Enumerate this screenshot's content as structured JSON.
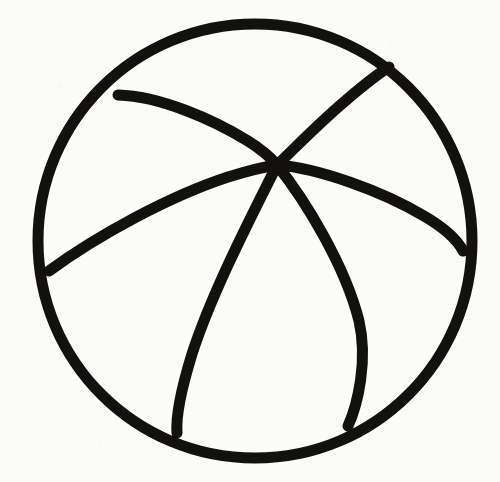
{
  "document": {
    "kind": "line-drawing",
    "subject": "beach ball",
    "description": "Hand-drawn black ink outline of a beach ball: one large circle crossed by five curved seam lines that all converge at a single point above the circle's centre.",
    "medium": "ink on paper",
    "canvas": {
      "width": 500,
      "height": 482
    },
    "background_color": "#fbfbfa",
    "ink_color": "#121110"
  },
  "geometry": {
    "outline": {
      "name": "ball-outline",
      "shape": "circle",
      "center": {
        "x": 255,
        "y": 241
      },
      "radius": 217,
      "stroke_width": 11,
      "bounds": {
        "left": 38,
        "top": 24,
        "right": 472,
        "bottom": 458
      },
      "path": "M 255 24 C 375 24 472 121 472 241 C 472 361 375 458 255 458 C 135 458 38 361 38 241 C 38 121 135 24 255 24 Z"
    },
    "convergence_point": {
      "x": 277,
      "y": 165
    },
    "seams": [
      {
        "name": "seam-upper-left",
        "from": {
          "x": 118,
          "y": 95
        },
        "to": {
          "x": 277,
          "y": 165
        },
        "stroke_width": 11,
        "path": "M 118 95 C 160 96 214 120 248 141 C 264 151 272 159 277 165"
      },
      {
        "name": "seam-upper-right",
        "from": {
          "x": 277,
          "y": 165
        },
        "to": {
          "x": 389,
          "y": 67
        },
        "stroke_width": 11,
        "path": "M 277 165 C 292 151 318 124 344 102 C 366 83 381 72 389 67"
      },
      {
        "name": "seam-left",
        "from": {
          "x": 49,
          "y": 271
        },
        "to": {
          "x": 277,
          "y": 165
        },
        "stroke_width": 11,
        "path": "M 49 271 C 98 235 170 196 228 177 C 254 169 270 166 277 165"
      },
      {
        "name": "seam-right",
        "from": {
          "x": 277,
          "y": 165
        },
        "to": {
          "x": 463,
          "y": 251
        },
        "stroke_width": 11,
        "path": "M 277 165 C 318 168 382 191 424 216 C 448 230 459 243 463 251"
      },
      {
        "name": "seam-lower-left",
        "from": {
          "x": 277,
          "y": 165
        },
        "to": {
          "x": 177,
          "y": 433
        },
        "stroke_width": 11,
        "path": "M 277 165 C 252 215 212 292 192 354 C 180 393 176 420 177 433"
      },
      {
        "name": "seam-lower-right",
        "from": {
          "x": 277,
          "y": 165
        },
        "to": {
          "x": 348,
          "y": 426
        },
        "stroke_width": 11,
        "path": "M 277 165 C 305 200 345 265 359 321 C 368 360 358 404 348 426"
      }
    ]
  },
  "labels": {
    "artboard": "drawing-canvas",
    "figure": "beach-ball-figure"
  }
}
